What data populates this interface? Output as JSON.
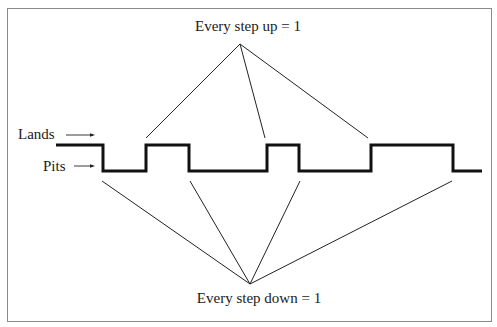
{
  "diagram": {
    "labels": {
      "step_up": "Every step up = 1",
      "step_down": "Every step down = 1",
      "lands": "Lands",
      "pits": "Pits"
    },
    "colors": {
      "border": "#8a8a8a",
      "signal": "#111111",
      "leader_lines": "#222222",
      "text": "#1a1a1a",
      "background": "#ffffff"
    },
    "signal": {
      "levels": [
        "land",
        "pit"
      ],
      "sequence": [
        "land",
        "pit",
        "land",
        "pit",
        "land",
        "pit",
        "land",
        "pit"
      ],
      "transitions": [
        "down",
        "up",
        "down",
        "up",
        "down",
        "up",
        "down"
      ],
      "step_up_count": 3,
      "step_down_count": 4
    }
  }
}
